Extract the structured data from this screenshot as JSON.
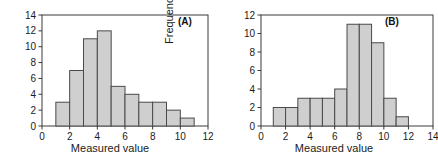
{
  "figure": {
    "panels": [
      {
        "id": "A",
        "label": "(A)"
      },
      {
        "id": "B",
        "label": "(B)"
      }
    ]
  },
  "chart_data": [
    {
      "type": "bar",
      "title": "",
      "panel_label": "(A)",
      "xlabel": "Measured value",
      "ylabel": "Frequency",
      "xlim": [
        0,
        12
      ],
      "ylim": [
        0,
        14
      ],
      "xticks": [
        0,
        2,
        4,
        6,
        8,
        10,
        12
      ],
      "xticklabels": [
        "0",
        "2",
        "4",
        "6",
        "8",
        "10",
        "12"
      ],
      "yticks": [
        0,
        2,
        4,
        6,
        8,
        10,
        12,
        14
      ],
      "yticklabels": [
        "0",
        "2",
        "4",
        "6",
        "8",
        "10",
        "12",
        "14"
      ],
      "grid": false,
      "legend": null,
      "bin_width": 1,
      "bin_edges": [
        1,
        2,
        3,
        4,
        5,
        6,
        7,
        8,
        9,
        10,
        11
      ],
      "categories": [
        "1-2",
        "2-3",
        "3-4",
        "4-5",
        "5-6",
        "6-7",
        "7-8",
        "8-9",
        "9-10",
        "10-11"
      ],
      "values": [
        3,
        7,
        11,
        12,
        5,
        4,
        3,
        3,
        2,
        1
      ],
      "bar_fill": "#cfcfcf",
      "bar_edge": "#4a4a4a"
    },
    {
      "type": "bar",
      "title": "",
      "panel_label": "(B)",
      "xlabel": "Measured value",
      "ylabel": "Frequency",
      "xlim": [
        0,
        14
      ],
      "ylim": [
        0,
        12
      ],
      "xticks": [
        0,
        2,
        4,
        6,
        8,
        10,
        12,
        14
      ],
      "xticklabels": [
        "0",
        "2",
        "4",
        "6",
        "8",
        "10",
        "12",
        "14"
      ],
      "yticks": [
        0,
        2,
        4,
        6,
        8,
        10,
        12
      ],
      "yticklabels": [
        "0",
        "2",
        "4",
        "6",
        "8",
        "10",
        "12"
      ],
      "grid": false,
      "legend": null,
      "bin_width": 1,
      "bin_edges": [
        1,
        2,
        3,
        4,
        5,
        6,
        7,
        8,
        9,
        10,
        11,
        12
      ],
      "categories": [
        "1-2",
        "2-3",
        "3-4",
        "4-5",
        "5-6",
        "6-7",
        "7-8",
        "8-9",
        "9-10",
        "10-11",
        "11-12"
      ],
      "values": [
        2,
        2,
        3,
        3,
        3,
        4,
        11,
        11,
        9,
        3,
        1
      ],
      "bar_fill": "#cfcfcf",
      "bar_edge": "#4a4a4a"
    }
  ]
}
